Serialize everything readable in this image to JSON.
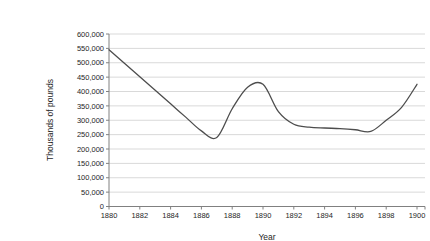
{
  "chart_data": {
    "type": "line",
    "title": "",
    "xlabel": "Year",
    "ylabel": "Thousands of pounds",
    "x": [
      1880,
      1881,
      1882,
      1883,
      1884,
      1885,
      1886,
      1887,
      1888,
      1889,
      1890,
      1891,
      1892,
      1893,
      1894,
      1895,
      1896,
      1897,
      1898,
      1899,
      1900
    ],
    "series": [
      {
        "name": "series-1",
        "values": [
          545000,
          498000,
          451000,
          404000,
          357000,
          310000,
          263000,
          240000,
          340000,
          415000,
          425000,
          330000,
          286000,
          276000,
          273000,
          271000,
          267000,
          261000,
          300000,
          345000,
          425000
        ]
      }
    ],
    "xlim": [
      1880,
      1900
    ],
    "ylim": [
      0,
      600000
    ],
    "x_ticks": [
      1880,
      1882,
      1884,
      1886,
      1888,
      1890,
      1892,
      1894,
      1896,
      1898,
      1900
    ],
    "y_ticks": [
      0,
      50000,
      100000,
      150000,
      200000,
      250000,
      300000,
      350000,
      400000,
      450000,
      500000,
      550000,
      600000
    ],
    "grid": true,
    "legend": "none",
    "smooth": true,
    "colors": {
      "line": "#4d4d4d",
      "grid": "#d9d9d9",
      "axis": "#808080",
      "text": "#262626",
      "background": "#ffffff"
    }
  }
}
